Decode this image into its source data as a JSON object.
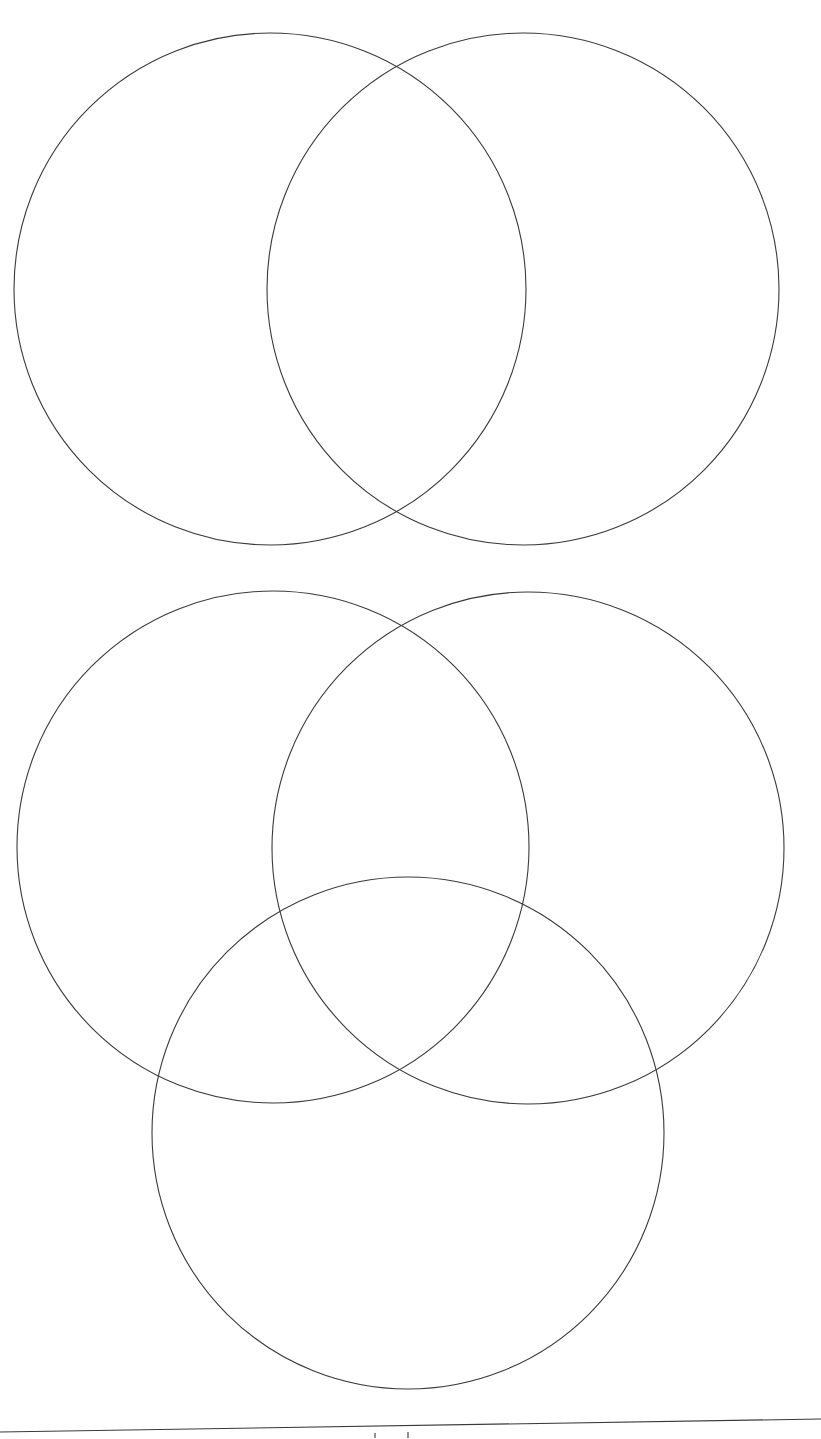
{
  "page": {
    "background_color": "#ffffff",
    "width": 821,
    "height": 1439,
    "stroke_color": "#3a3a3a",
    "stroke_width": 1.1
  },
  "chart_data": {
    "type": "diagram",
    "diagram_type": "venn",
    "title": "",
    "subtitle": "",
    "xlabel": "",
    "ylabel": "",
    "grid": false,
    "legend": null,
    "annotations": [],
    "labels": [],
    "groups": [
      {
        "id": "two-set-venn",
        "name": "Two-Circle Venn Diagram",
        "set_count": 2,
        "regions": [
          "A only",
          "A and B",
          "B only"
        ],
        "circles": [
          {
            "id": "g1-left",
            "label": "",
            "cx": 270,
            "cy": 289,
            "r": 256
          },
          {
            "id": "g1-right",
            "label": "",
            "cx": 523,
            "cy": 289,
            "r": 256
          }
        ]
      },
      {
        "id": "three-set-venn",
        "name": "Three-Circle Venn Diagram",
        "set_count": 3,
        "regions": [
          "A only",
          "B only",
          "C only",
          "A and B",
          "A and C",
          "B and C",
          "A and B and C"
        ],
        "circles": [
          {
            "id": "g2-top-left",
            "label": "",
            "cx": 273,
            "cy": 847,
            "r": 256
          },
          {
            "id": "g2-top-right",
            "label": "",
            "cx": 528,
            "cy": 848,
            "r": 256
          },
          {
            "id": "g2-bottom",
            "label": "",
            "cx": 408,
            "cy": 1133,
            "r": 256
          }
        ]
      }
    ],
    "rules": [
      {
        "id": "footer-rule",
        "x1": 0,
        "y1": 1432,
        "x2": 821,
        "y2": 1419
      }
    ],
    "ticks": [
      {
        "id": "tick-left",
        "x1": 375,
        "y1": 1433,
        "x2": 375,
        "y2": 1438
      },
      {
        "id": "tick-right",
        "x1": 408,
        "y1": 1432,
        "x2": 408,
        "y2": 1438
      }
    ]
  }
}
